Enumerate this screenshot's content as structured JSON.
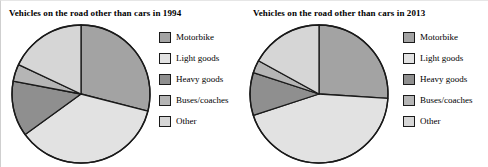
{
  "figure": {
    "background_color": "#ffffff",
    "outline_color": "#1a1a1a"
  },
  "panels": [
    {
      "id": "1994",
      "title": "Vehicles on the road other than cars in 1994",
      "legend": [
        {
          "label": "Motorbike",
          "color": "#a3a3a3",
          "swatch_name": "legend-swatch-motorbike"
        },
        {
          "label": "Light goods",
          "color": "#e2e2e2",
          "swatch_name": "legend-swatch-light-goods"
        },
        {
          "label": "Heavy goods",
          "color": "#8f8f8f",
          "swatch_name": "legend-swatch-heavy-goods"
        },
        {
          "label": "Buses/coaches",
          "color": "#b5b5b5",
          "swatch_name": "legend-swatch-buses-coaches"
        },
        {
          "label": "Other",
          "color": "#d6d6d6",
          "swatch_name": "legend-swatch-other"
        }
      ]
    },
    {
      "id": "2013",
      "title": "Vehicles on the road other than cars in 2013",
      "legend": [
        {
          "label": "Motorbike",
          "color": "#a3a3a3",
          "swatch_name": "legend-swatch-motorbike"
        },
        {
          "label": "Light goods",
          "color": "#e2e2e2",
          "swatch_name": "legend-swatch-light-goods"
        },
        {
          "label": "Heavy goods",
          "color": "#8f8f8f",
          "swatch_name": "legend-swatch-heavy-goods"
        },
        {
          "label": "Buses/coaches",
          "color": "#b5b5b5",
          "swatch_name": "legend-swatch-buses-coaches"
        },
        {
          "label": "Other",
          "color": "#d6d6d6",
          "swatch_name": "legend-swatch-other"
        }
      ]
    }
  ],
  "chart_data": [
    {
      "type": "pie",
      "title": "Vehicles on the road other than cars in 1994",
      "xlabel": "",
      "ylabel": "",
      "legend_position": "right",
      "grid": false,
      "start_angle_deg": 0,
      "direction": "clockwise",
      "categories": [
        "Motorbike",
        "Light goods",
        "Heavy goods",
        "Buses/coaches",
        "Other"
      ],
      "values": [
        29,
        36,
        13,
        4,
        18
      ],
      "units": "percent",
      "colors": [
        "#a3a3a3",
        "#e2e2e2",
        "#8f8f8f",
        "#b5b5b5",
        "#d6d6d6"
      ],
      "slices": [
        {
          "label": "Motorbike",
          "value": 29,
          "start_deg": 0,
          "end_deg": 104.4,
          "color": "#a3a3a3"
        },
        {
          "label": "Light goods",
          "value": 36,
          "start_deg": 104.4,
          "end_deg": 234.0,
          "color": "#e2e2e2"
        },
        {
          "label": "Heavy goods",
          "value": 13,
          "start_deg": 234.0,
          "end_deg": 280.8,
          "color": "#8f8f8f"
        },
        {
          "label": "Buses/coaches",
          "value": 4,
          "start_deg": 280.8,
          "end_deg": 295.2,
          "color": "#b5b5b5"
        },
        {
          "label": "Other",
          "value": 18,
          "start_deg": 295.2,
          "end_deg": 360.0,
          "color": "#d6d6d6"
        }
      ]
    },
    {
      "type": "pie",
      "title": "Vehicles on the road other than cars in 2013",
      "xlabel": "",
      "ylabel": "",
      "legend_position": "right",
      "grid": false,
      "start_angle_deg": 0,
      "direction": "clockwise",
      "categories": [
        "Motorbike",
        "Light goods",
        "Heavy goods",
        "Buses/coaches",
        "Other"
      ],
      "values": [
        26,
        44,
        10,
        3,
        17
      ],
      "units": "percent",
      "colors": [
        "#a3a3a3",
        "#e2e2e2",
        "#8f8f8f",
        "#b5b5b5",
        "#d6d6d6"
      ],
      "slices": [
        {
          "label": "Motorbike",
          "value": 26,
          "start_deg": 0,
          "end_deg": 93.6,
          "color": "#a3a3a3"
        },
        {
          "label": "Light goods",
          "value": 44,
          "start_deg": 93.6,
          "end_deg": 252.0,
          "color": "#e2e2e2"
        },
        {
          "label": "Heavy goods",
          "value": 10,
          "start_deg": 252.0,
          "end_deg": 288.0,
          "color": "#8f8f8f"
        },
        {
          "label": "Buses/coaches",
          "value": 3,
          "start_deg": 288.0,
          "end_deg": 298.8,
          "color": "#b5b5b5"
        },
        {
          "label": "Other",
          "value": 17,
          "start_deg": 298.8,
          "end_deg": 360.0,
          "color": "#d6d6d6"
        }
      ]
    }
  ]
}
